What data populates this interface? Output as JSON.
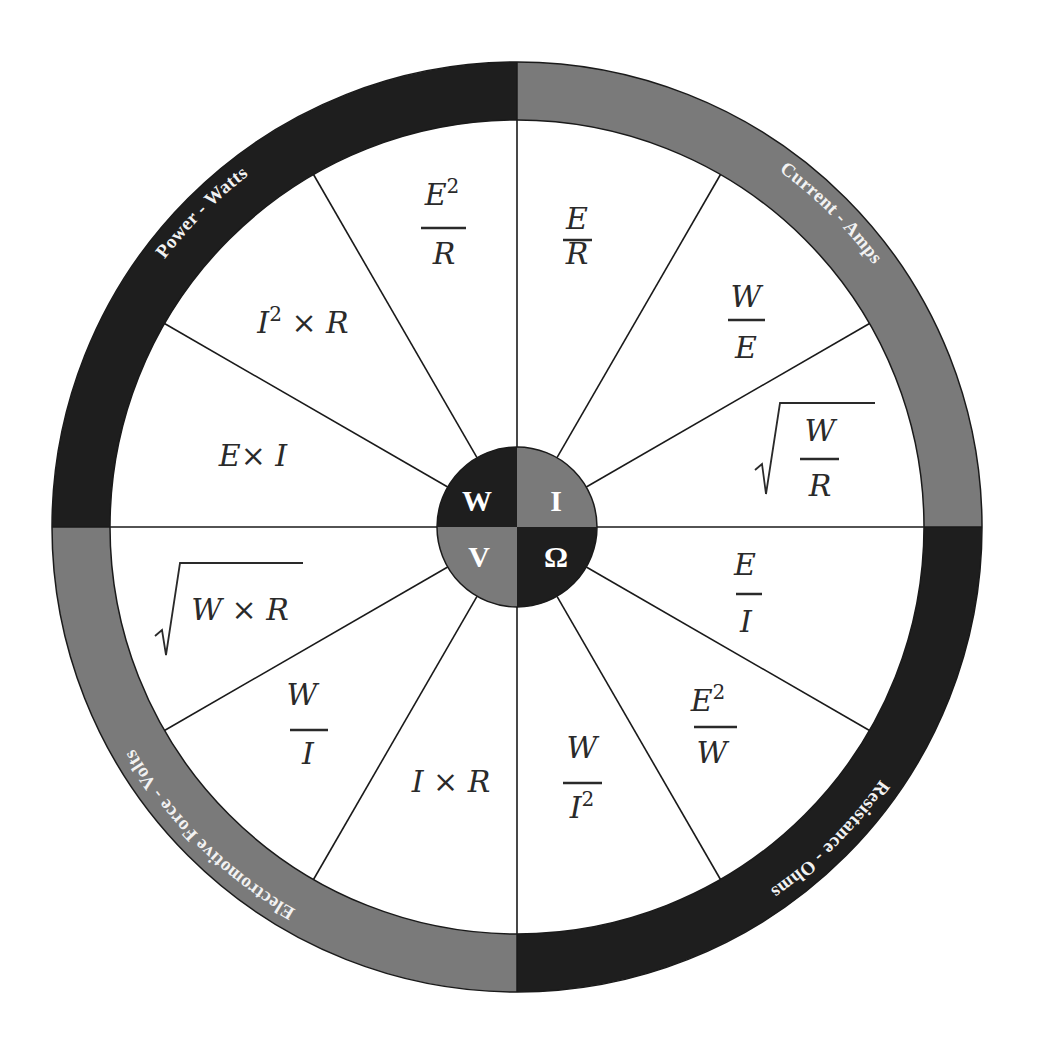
{
  "geometry": {
    "cx": 517,
    "cy": 527,
    "outer_r": 465,
    "inner_r": 407,
    "hub_r": 80
  },
  "colors": {
    "dark": "#1e1e1e",
    "gray": "#7a7a7a",
    "line": "#1a1a1a",
    "text": "#2a2a2a",
    "label": "#f2f2f2"
  },
  "quadrants": [
    {
      "id": "power",
      "label": "Power - Watts",
      "symbol": "W",
      "color": "dark",
      "position": "top-left"
    },
    {
      "id": "current",
      "label": "Current - Amps",
      "symbol": "I",
      "color": "gray",
      "position": "top-right"
    },
    {
      "id": "resistance",
      "label": "Resistance - Ohms",
      "symbol": "Ω",
      "color": "dark",
      "position": "bottom-right"
    },
    {
      "id": "voltage",
      "label": "Electromotive Force - Volts",
      "symbol": "V",
      "color": "gray",
      "position": "bottom-left"
    }
  ],
  "hub": {
    "top_left": "W",
    "top_right": "I",
    "bottom_left": "V",
    "bottom_right": "Ω"
  },
  "segments": [
    {
      "quadrant": "current",
      "formula": "E / R"
    },
    {
      "quadrant": "current",
      "formula": "W / E"
    },
    {
      "quadrant": "current",
      "formula": "√(W / R)"
    },
    {
      "quadrant": "resistance",
      "formula": "E / I"
    },
    {
      "quadrant": "resistance",
      "formula": "E² / W"
    },
    {
      "quadrant": "resistance",
      "formula": "W / I²"
    },
    {
      "quadrant": "voltage",
      "formula": "I × R"
    },
    {
      "quadrant": "voltage",
      "formula": "W / I"
    },
    {
      "quadrant": "voltage",
      "formula": "√(W × R)"
    },
    {
      "quadrant": "power",
      "formula": "E × I"
    },
    {
      "quadrant": "power",
      "formula": "I² × R"
    },
    {
      "quadrant": "power",
      "formula": "E² / R"
    }
  ],
  "f": {
    "E": "E",
    "R": "R",
    "W": "W",
    "I": "I",
    "x": "×",
    "sq": "2"
  }
}
